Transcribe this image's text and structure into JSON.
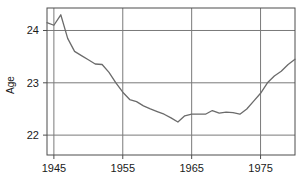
{
  "chart_data": {
    "type": "line",
    "title": "",
    "xlabel": "",
    "ylabel": "Age",
    "xlim": [
      1944,
      1980
    ],
    "ylim": [
      21.62,
      24.43
    ],
    "grid": true,
    "legend": false,
    "line_color": "#6b6b6b",
    "frame_color": "#4d4d4d",
    "grid_color": "#7a7a7a",
    "background": "#ffffff",
    "xticks": [
      1945,
      1955,
      1965,
      1975
    ],
    "xtick_labels": [
      "1945",
      "1955",
      "1965",
      "1975"
    ],
    "yticks": [
      22,
      23,
      24
    ],
    "ytick_labels": [
      "22",
      "23",
      "24"
    ],
    "series": [
      {
        "name": "Mean age",
        "x": [
          1944,
          1945,
          1946,
          1947,
          1948,
          1949,
          1950,
          1951,
          1952,
          1953,
          1954,
          1955,
          1956,
          1957,
          1958,
          1959,
          1960,
          1961,
          1962,
          1963,
          1964,
          1965,
          1966,
          1967,
          1968,
          1969,
          1970,
          1971,
          1972,
          1973,
          1974,
          1975,
          1976,
          1977,
          1978,
          1979,
          1980
        ],
        "y": [
          24.15,
          24.1,
          24.3,
          23.85,
          23.6,
          23.52,
          23.44,
          23.36,
          23.35,
          23.2,
          23.0,
          22.82,
          22.68,
          22.64,
          22.56,
          22.5,
          22.45,
          22.4,
          22.33,
          22.25,
          22.37,
          22.4,
          22.4,
          22.4,
          22.47,
          22.42,
          22.44,
          22.43,
          22.4,
          22.5,
          22.65,
          22.8,
          23.0,
          23.13,
          23.22,
          23.35,
          23.45
        ]
      }
    ]
  },
  "axis": {
    "y_title": "Age"
  }
}
